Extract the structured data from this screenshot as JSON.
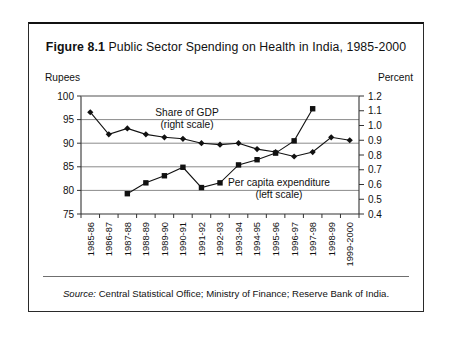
{
  "figure": {
    "number": "Figure 8.1",
    "title": "Public Sector Spending on Health in India, 1985-2000",
    "left_axis_label": "Rupees",
    "right_axis_label": "Percent",
    "source_prefix": "Source:",
    "source_text": "Central Statistical Office; Ministry of Finance; Reserve Bank of India."
  },
  "chart_data": {
    "type": "line",
    "title": "Public Sector Spending on Health in India, 1985-2000",
    "xlabel": "",
    "ylabel": "Rupees",
    "y2label": "Percent",
    "ylim": [
      75,
      100
    ],
    "y2lim": [
      0.4,
      1.2
    ],
    "yticks": [
      75,
      80,
      85,
      90,
      95,
      100
    ],
    "y2ticks": [
      0.4,
      0.5,
      0.6,
      0.7,
      0.8,
      0.9,
      1.0,
      1.1,
      1.2
    ],
    "grid": "horizontal",
    "legend": "inline-annotations",
    "categories": [
      "1985-86",
      "1986-87",
      "1987-88",
      "1988-89",
      "1989-90",
      "1990-91",
      "1991-92",
      "1992-93",
      "1993-94",
      "1994-95",
      "1995-96",
      "1996-97",
      "1997-98",
      "1998-99",
      "1999-2000"
    ],
    "series": [
      {
        "name": "Share of GDP",
        "axis": "right",
        "scale_note": "(right scale)",
        "marker": "diamond",
        "unit": "percent of GDP",
        "x": [
          "1985-86",
          "1986-87",
          "1987-88",
          "1988-89",
          "1989-90",
          "1990-91",
          "1991-92",
          "1992-93",
          "1993-94",
          "1994-95",
          "1995-96",
          "1996-97",
          "1997-98",
          "1998-99",
          "1999-2000"
        ],
        "values": [
          1.09,
          0.94,
          0.98,
          0.94,
          0.92,
          0.91,
          0.88,
          0.87,
          0.88,
          0.84,
          0.82,
          0.79,
          0.82,
          0.92,
          0.9
        ]
      },
      {
        "name": "Per capita expenditure",
        "axis": "left",
        "scale_note": "(left scale)",
        "marker": "square",
        "unit": "rupees",
        "x": [
          "1987-88",
          "1988-89",
          "1989-90",
          "1990-91",
          "1991-92",
          "1992-93",
          "1993-94",
          "1994-95",
          "1995-96",
          "1996-97",
          "1997-98"
        ],
        "values": [
          79.3,
          81.6,
          83.1,
          84.9,
          80.6,
          81.6,
          85.4,
          86.5,
          87.9,
          90.5,
          97.3
        ]
      }
    ],
    "annotations": [
      {
        "text": "Share of GDP",
        "sub": "(right scale)",
        "series": "Share of GDP"
      },
      {
        "text": "Per capita expenditure",
        "sub": "(left scale)",
        "series": "Per capita expenditure"
      }
    ]
  }
}
